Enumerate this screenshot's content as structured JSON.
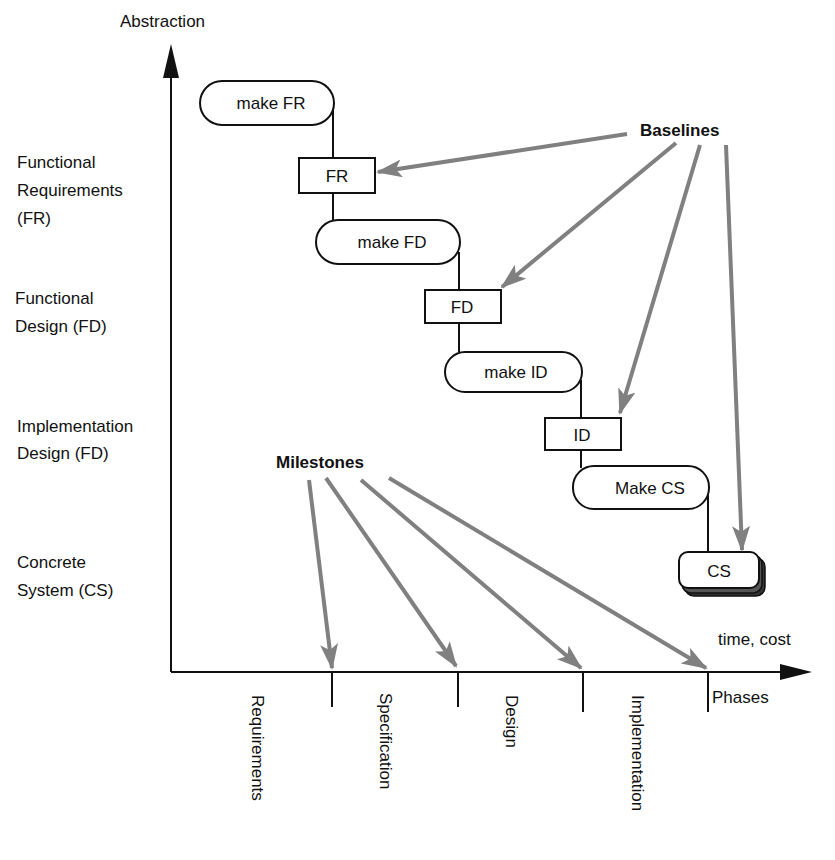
{
  "axes": {
    "y_label": "Abstraction",
    "x_label": "time, cost",
    "phases_label": "Phases"
  },
  "levels": [
    {
      "lines": [
        "Functional",
        "Requirements",
        "(FR)"
      ]
    },
    {
      "lines": [
        "Functional",
        "Design (FD)"
      ]
    },
    {
      "lines": [
        "Implementation",
        "Design (FD)"
      ]
    },
    {
      "lines": [
        "Concrete",
        "System (CS)"
      ]
    }
  ],
  "activities": [
    "make FR",
    "make FD",
    "make ID",
    "Make CS"
  ],
  "baselines": [
    "FR",
    "FD",
    "ID",
    "CS"
  ],
  "annotations": {
    "baselines": "Baselines",
    "milestones": "Milestones"
  },
  "phases": [
    "Requirements",
    "Specification",
    "Design",
    "Implementation"
  ],
  "colors": {
    "arrow": "#808080",
    "line": "#111111"
  }
}
